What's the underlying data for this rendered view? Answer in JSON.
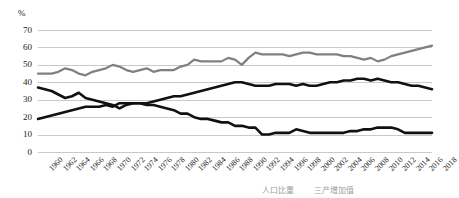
{
  "chart_data": {
    "type": "line",
    "title": "",
    "xlabel": "",
    "ylabel": "%",
    "ylim": [
      0,
      70
    ],
    "grid": true,
    "legend_position": "bottom-right",
    "x": [
      1960,
      1961,
      1962,
      1963,
      1964,
      1965,
      1966,
      1967,
      1968,
      1969,
      1970,
      1971,
      1972,
      1973,
      1974,
      1975,
      1976,
      1977,
      1978,
      1979,
      1980,
      1981,
      1982,
      1983,
      1984,
      1985,
      1986,
      1987,
      1988,
      1989,
      1990,
      1991,
      1992,
      1993,
      1994,
      1995,
      1996,
      1997,
      1998,
      1999,
      2000,
      2001,
      2002,
      2003,
      2004,
      2005,
      2006,
      2007,
      2008,
      2009,
      2010,
      2011,
      2012,
      2013,
      2014,
      2015,
      2016,
      2017,
      2018
    ],
    "xticks": [
      1960,
      1962,
      1964,
      1966,
      1968,
      1970,
      1972,
      1974,
      1976,
      1978,
      1980,
      1982,
      1984,
      1986,
      1988,
      1990,
      1992,
      1994,
      1996,
      1998,
      2000,
      2002,
      2004,
      2006,
      2008,
      2010,
      2012,
      2014,
      2016,
      2018
    ],
    "yticks": [
      0,
      10,
      20,
      30,
      40,
      50,
      60,
      70
    ],
    "series": [
      {
        "name": "gray-series",
        "color": "#808080",
        "width": 2.2,
        "values": [
          45,
          45,
          45,
          46,
          48,
          47,
          45,
          44,
          46,
          47,
          48,
          50,
          49,
          47,
          46,
          47,
          48,
          46,
          47,
          47,
          47,
          49,
          50,
          53,
          52,
          52,
          52,
          52,
          54,
          53,
          50,
          54,
          57,
          56,
          56,
          56,
          56,
          55,
          56,
          57,
          57,
          56,
          56,
          56,
          56,
          55,
          55,
          54,
          53,
          54,
          52,
          53,
          55,
          56,
          57,
          58,
          59,
          60,
          61
        ]
      },
      {
        "name": "black-upper-series",
        "color": "#111111",
        "width": 2.6,
        "values": [
          19,
          20,
          21,
          22,
          23,
          24,
          25,
          26,
          26,
          26,
          27,
          26,
          28,
          28,
          28,
          28,
          28,
          29,
          30,
          31,
          32,
          32,
          33,
          34,
          35,
          36,
          37,
          38,
          39,
          40,
          40,
          39,
          38,
          38,
          38,
          39,
          39,
          39,
          38,
          39,
          38,
          38,
          39,
          40,
          40,
          41,
          41,
          42,
          42,
          41,
          42,
          41,
          40,
          40,
          39,
          38,
          38,
          37,
          36
        ]
      },
      {
        "name": "black-lower-series",
        "color": "#111111",
        "width": 2.6,
        "values": [
          37,
          36,
          35,
          33,
          31,
          32,
          34,
          31,
          30,
          29,
          28,
          27,
          25,
          27,
          28,
          28,
          27,
          27,
          26,
          25,
          24,
          22,
          22,
          20,
          19,
          19,
          18,
          17,
          17,
          15,
          15,
          14,
          14,
          10,
          10,
          11,
          11,
          11,
          13,
          12,
          11,
          11,
          11,
          11,
          11,
          11,
          12,
          12,
          13,
          13,
          14,
          14,
          14,
          13,
          11,
          11,
          11,
          11,
          11
        ]
      }
    ]
  },
  "legend": {
    "entries": [
      {
        "label": "人口比重",
        "marker_color": "#111111"
      },
      {
        "label": "三产增加值",
        "marker_color": "#808080"
      }
    ]
  }
}
